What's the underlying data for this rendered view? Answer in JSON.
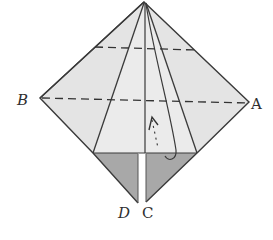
{
  "diagram": {
    "type": "origami-fold-step",
    "labels": {
      "a": "A",
      "b": "B",
      "c": "C",
      "d": "D"
    },
    "colors": {
      "paper_light": "#e6e6e6",
      "paper_mid": "#d9d9d9",
      "paper_dark": "#a9a9a9",
      "line": "#3a3a3a",
      "background": "#ffffff"
    },
    "annotations": {
      "fold_arrow": "lift-flap-arrow",
      "dashed_lines": [
        "upper-valley-fold",
        "middle-fold-B-A"
      ]
    }
  }
}
